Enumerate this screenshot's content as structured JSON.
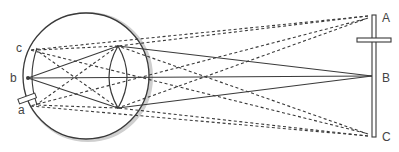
{
  "diagram": {
    "labels": {
      "object_top": "A",
      "object_middle": "B",
      "object_bottom": "C",
      "retina_top": "c",
      "retina_middle": "b",
      "retina_bottom": "a"
    },
    "colors": {
      "line": "#3a3a3a",
      "shadow": "#bdbdbd",
      "label": "#444444"
    }
  }
}
